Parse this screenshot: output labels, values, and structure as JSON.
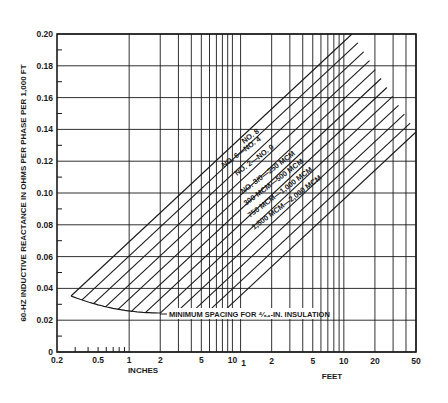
{
  "chart_data": {
    "type": "line",
    "title": "",
    "ylabel": "60-HZ INDUCTIVE REACTANCE IN OHMS PER PHASE PER 1,000 FT",
    "xlabel_inches": "INCHES",
    "xlabel_feet": "FEET",
    "x_scale": "log",
    "x_unit_note": "Conductor spacing; inches from 0.2 to 12, then feet from 1 to 50",
    "ylim": [
      0,
      0.2
    ],
    "y_ticks": [
      "0",
      "0.02",
      "0.04",
      "0.06",
      "0.08",
      "0.10",
      "0.12",
      "0.14",
      "0.16",
      "0.18",
      "0.20"
    ],
    "x_ticks_inches": [
      "0.2",
      "0.5",
      "1",
      "2",
      "5",
      "10"
    ],
    "x_ticks_feet": [
      "1",
      "2",
      "5",
      "10",
      "20",
      "50"
    ],
    "grid": true,
    "series": [
      {
        "name": "NO. 8",
        "points": [
          [
            0.3,
            0.035
          ],
          [
            600,
            0.2
          ]
        ]
      },
      {
        "name": "NO. 6",
        "points": [
          [
            0.33,
            0.035
          ],
          [
            600,
            0.196
          ]
        ]
      },
      {
        "name": "NO. 4",
        "points": [
          [
            0.36,
            0.034
          ],
          [
            600,
            0.191
          ]
        ]
      },
      {
        "name": "NO. 2",
        "points": [
          [
            0.4,
            0.033
          ],
          [
            600,
            0.186
          ]
        ]
      },
      {
        "name": "NO. 0",
        "points": [
          [
            0.45,
            0.032
          ],
          [
            600,
            0.181
          ]
        ]
      },
      {
        "name": "NO. 3/0",
        "points": [
          [
            0.5,
            0.031
          ],
          [
            600,
            0.175
          ]
        ]
      },
      {
        "name": "250 MCM",
        "points": [
          [
            0.58,
            0.03
          ],
          [
            600,
            0.17
          ]
        ]
      },
      {
        "name": "500 MCM",
        "points": [
          [
            0.7,
            0.028
          ],
          [
            600,
            0.162
          ]
        ]
      },
      {
        "name": "750 MCM",
        "points": [
          [
            0.85,
            0.027
          ],
          [
            600,
            0.156
          ]
        ]
      },
      {
        "name": "1,000 MCM",
        "points": [
          [
            1.0,
            0.026
          ],
          [
            600,
            0.151
          ]
        ]
      },
      {
        "name": "1,500 MCM",
        "points": [
          [
            1.4,
            0.025
          ],
          [
            600,
            0.145
          ]
        ]
      },
      {
        "name": "2,000 MCM",
        "points": [
          [
            2.0,
            0.024
          ],
          [
            600,
            0.139
          ]
        ]
      }
    ],
    "annotations": [
      "NO. 8",
      "NO. 6—NO. 4",
      "NO. 2—NO. 0",
      "NO. 3/0—250 MCM",
      "300 MCM—500 MCM",
      "750 MCM—1,000 MCM",
      "1,500 MCM—2,000 MCM",
      "MINIMUM SPACING FOR ⁴⁄₆₄-IN. INSULATION"
    ],
    "legend": "none (curves labeled inline)"
  },
  "labels": {
    "ylabel": "60-HZ INDUCTIVE REACTANCE IN OHMS PER PHASE PER 1,000 FT",
    "xlabel_inches": "INCHES",
    "xlabel_feet": "FEET",
    "min_spacing": "MINIMUM SPACING FOR ⁴⁄₆₄-IN. INSULATION",
    "curve_labels": [
      "NO. 8",
      "NO. 6—NO. 4",
      "NO. 2—NO. 0",
      "NO. 3/0—250 MCM",
      "300 MCM—500 MCM",
      "750 MCM—1,000 MCM",
      "1,500 MCM—2,000 MCM"
    ]
  }
}
